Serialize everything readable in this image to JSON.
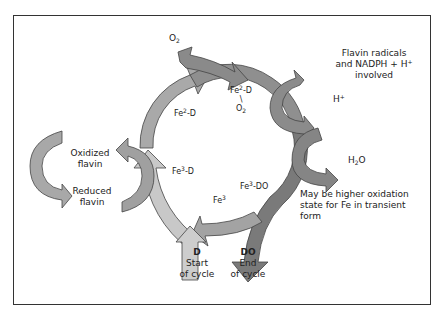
{
  "diagram": {
    "type": "cycle",
    "colors": {
      "light_arrow": "#c8c8c8",
      "mid_arrow": "#a9a9a9",
      "dark_arrow": "#8c8c8c",
      "darkest_arrow": "#7a7a7a",
      "frame": "#333333"
    },
    "labels": {
      "o2_input": {
        "base": "O",
        "sub": "2"
      },
      "flavin_note": [
        "Flavin radicals",
        "and NADPH + H",
        "involved"
      ],
      "flavin_note_sup": "+",
      "h_plus": {
        "base": "H",
        "sup": "+"
      },
      "h2o": {
        "base": "H",
        "sub": "2",
        "tail": "O"
      },
      "oxidation_note": [
        "May be higher oxidation",
        "state for Fe in transient",
        "form"
      ],
      "oxidized_flavin": [
        "Oxidized",
        "flavin"
      ],
      "reduced_flavin": [
        "Reduced",
        "flavin"
      ],
      "fe2_d_left": {
        "a": "Fe",
        "sup": "2",
        "b": "-D"
      },
      "fe2_d_o2": {
        "a": "Fe",
        "sup": "2",
        "b": "-D",
        "bond": "\\",
        "o": "O",
        "sub": "2"
      },
      "fe3_d": {
        "a": "Fe",
        "sup": "3",
        "b": "-D"
      },
      "fe3_do": {
        "a": "Fe",
        "sup": "3",
        "b": "-DO"
      },
      "fe3": {
        "a": "Fe",
        "sup": "3"
      },
      "start": {
        "title": "D",
        "line1": "Start",
        "line2": "of cycle"
      },
      "end": {
        "title": "DO",
        "line1": "End",
        "line2": "of cycle"
      }
    }
  }
}
